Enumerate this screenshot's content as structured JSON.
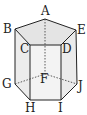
{
  "figure": {
    "type": "pentagonal prism",
    "labels": {
      "A": "A",
      "B": "B",
      "C": "C",
      "D": "D",
      "E": "E",
      "F": "F",
      "G": "G",
      "H": "H",
      "I": "I",
      "J": "J"
    },
    "colors": {
      "edge": "#222222",
      "top_face": "#e6e6e6",
      "side_face": "#efefef",
      "front_face": "#f2f2f2"
    }
  }
}
